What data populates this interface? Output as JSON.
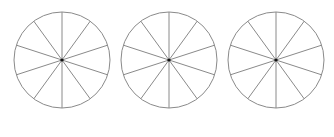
{
  "diagram": {
    "type": "divided-circles",
    "stroke_color": "#8a8a8a",
    "center_dot_color": "#111111",
    "background": "#ffffff",
    "circles": [
      {
        "cx": 62,
        "cy": 60,
        "r": 48,
        "sections": 10
      },
      {
        "cx": 169,
        "cy": 60,
        "r": 48,
        "sections": 10
      },
      {
        "cx": 276,
        "cy": 60,
        "r": 48,
        "sections": 10
      }
    ]
  }
}
